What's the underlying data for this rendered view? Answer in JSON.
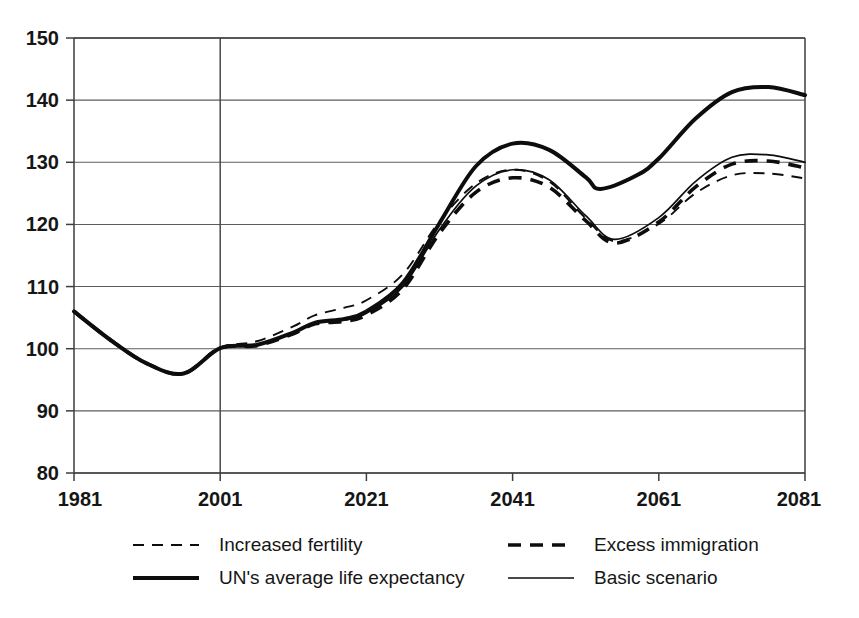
{
  "chart_data": {
    "type": "line",
    "title": "",
    "subtitle": "",
    "xlabel": "",
    "ylabel": "",
    "xlim": [
      1981,
      2081
    ],
    "ylim": [
      80,
      150
    ],
    "xticks": [
      1981,
      2001,
      2021,
      2041,
      2061,
      2081
    ],
    "yticks": [
      80,
      90,
      100,
      110,
      120,
      130,
      140,
      150
    ],
    "xtick_labels": [
      "1981",
      "2001",
      "2021",
      "2041",
      "2061",
      "2081"
    ],
    "ytick_labels": [
      "80",
      "90",
      "100",
      "110",
      "120",
      "130",
      "140",
      "150"
    ],
    "grid": "horizontal",
    "grid_on": true,
    "legend_position": "below-axes",
    "annotations": [
      {
        "text": "vertical reference line at 2001 separating history from projections",
        "x": 2001
      }
    ],
    "note_index_base": "Index, 1981 = 106 at start; value 100 reached at 2001",
    "series": [
      {
        "name": "Increased fertility",
        "style": "thin-dashed",
        "color": "#0d0d0d",
        "x": [
          1981,
          1986,
          1991,
          1996,
          2001,
          2006,
          2011,
          2014,
          2018,
          2021,
          2026,
          2031,
          2036,
          2041,
          2046,
          2051,
          2055,
          2061,
          2066,
          2071,
          2076,
          2081
        ],
        "values": [
          106.0,
          101.4,
          97.6,
          96.0,
          100.1,
          101.2,
          103.6,
          105.4,
          106.6,
          107.8,
          112.0,
          120.5,
          126.6,
          128.8,
          126.9,
          121.0,
          117.3,
          120.1,
          125.0,
          127.9,
          128.2,
          127.4
        ]
      },
      {
        "name": "Excess immigration",
        "style": "thick-dashed",
        "color": "#0d0d0d",
        "x": [
          1981,
          1986,
          1991,
          1996,
          2001,
          2006,
          2011,
          2014,
          2018,
          2021,
          2026,
          2031,
          2036,
          2041,
          2046,
          2051,
          2055,
          2061,
          2066,
          2071,
          2076,
          2081
        ],
        "values": [
          106.0,
          101.4,
          97.6,
          96.0,
          100.1,
          100.5,
          102.4,
          104.0,
          104.4,
          105.4,
          109.6,
          118.6,
          125.2,
          127.5,
          126.0,
          120.6,
          117.0,
          120.4,
          126.0,
          129.7,
          130.2,
          129.1
        ]
      },
      {
        "name": "UN's average life expectancy",
        "style": "thick-solid",
        "color": "#0d0d0d",
        "x": [
          1981,
          1986,
          1991,
          1996,
          2001,
          2006,
          2011,
          2014,
          2018,
          2021,
          2026,
          2031,
          2036,
          2041,
          2046,
          2051,
          2053,
          2058,
          2061,
          2066,
          2071,
          2076,
          2081
        ],
        "values": [
          106.0,
          101.4,
          97.6,
          96.0,
          100.1,
          100.6,
          102.6,
          104.2,
          104.8,
          106.0,
          110.6,
          120.2,
          129.4,
          133.0,
          132.0,
          127.6,
          125.7,
          127.9,
          130.6,
          137.0,
          141.3,
          142.1,
          140.8
        ]
      },
      {
        "name": "Basic scenario",
        "style": "thin-solid",
        "color": "#0d0d0d",
        "x": [
          1981,
          1986,
          1991,
          1996,
          2001,
          2006,
          2011,
          2014,
          2018,
          2021,
          2026,
          2031,
          2036,
          2041,
          2046,
          2051,
          2055,
          2061,
          2066,
          2071,
          2076,
          2081
        ],
        "values": [
          106.0,
          101.4,
          97.6,
          96.0,
          100.1,
          100.6,
          102.6,
          104.2,
          104.6,
          105.7,
          110.0,
          119.2,
          126.2,
          128.8,
          127.2,
          121.4,
          117.6,
          121.1,
          126.9,
          130.8,
          131.2,
          130.0
        ]
      }
    ],
    "legend": [
      {
        "label": "Increased fertility",
        "style": "thin-dashed",
        "column": 0,
        "row": 0
      },
      {
        "label": "Excess immigration",
        "style": "thick-dashed",
        "column": 1,
        "row": 0
      },
      {
        "label": "UN's average life expectancy",
        "style": "thick-solid",
        "column": 0,
        "row": 1
      },
      {
        "label": "Basic scenario",
        "style": "thin-solid",
        "column": 1,
        "row": 1
      }
    ]
  },
  "colors": {
    "ink": "#0d0d0d",
    "grid": "#5c5c5c",
    "frame": "#3d3d3d",
    "background": "#ffffff"
  }
}
